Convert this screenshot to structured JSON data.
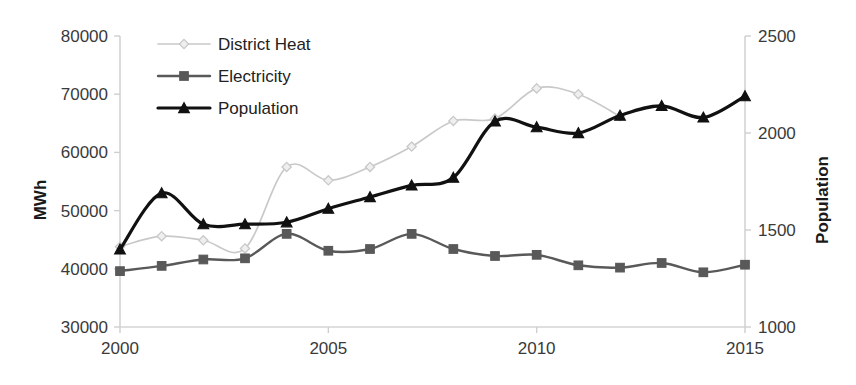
{
  "chart_data": {
    "type": "line",
    "title": "",
    "xlabel": "",
    "ylabel": "MWh",
    "y2label": "Population",
    "x": [
      2000,
      2001,
      2002,
      2003,
      2004,
      2005,
      2006,
      2007,
      2008,
      2009,
      2010,
      2011,
      2012,
      2013,
      2014,
      2015
    ],
    "xlim": [
      2000,
      2015
    ],
    "xticks": [
      "2000",
      "2005",
      "2010",
      "2015"
    ],
    "xtick_values": [
      2000,
      2005,
      2010,
      2015
    ],
    "ylim": [
      30000,
      80000
    ],
    "yticks": [
      "30000",
      "40000",
      "50000",
      "60000",
      "70000",
      "80000"
    ],
    "ytick_values": [
      30000,
      40000,
      50000,
      60000,
      70000,
      80000
    ],
    "y2lim": [
      1000,
      2500
    ],
    "y2ticks": [
      "1000",
      "1500",
      "2000",
      "2500"
    ],
    "y2tick_values": [
      1000,
      1500,
      2000,
      2500
    ],
    "grid": false,
    "legend_position": "top-left",
    "series": [
      {
        "name": "District Heat",
        "axis": "left",
        "color": "#c9c9c9",
        "marker": "diamond",
        "x": [
          2000,
          2001,
          2002,
          2003,
          2004,
          2005,
          2006,
          2007,
          2008,
          2009,
          2010,
          2011,
          2012
        ],
        "values": [
          43800,
          45600,
          44900,
          43500,
          57500,
          55200,
          57500,
          61000,
          65400,
          65800,
          71000,
          70000,
          66200
        ]
      },
      {
        "name": "Electricity",
        "axis": "left",
        "color": "#595959",
        "marker": "square",
        "x": [
          2000,
          2001,
          2002,
          2003,
          2004,
          2005,
          2006,
          2007,
          2008,
          2009,
          2010,
          2011,
          2012,
          2013,
          2014,
          2015
        ],
        "values": [
          39600,
          40500,
          41600,
          41800,
          46000,
          43100,
          43400,
          46000,
          43400,
          42200,
          42400,
          40600,
          40200,
          41000,
          39400,
          40700
        ]
      },
      {
        "name": "Population",
        "axis": "right",
        "color": "#111111",
        "marker": "triangle",
        "x": [
          2000,
          2001,
          2002,
          2003,
          2004,
          2005,
          2006,
          2007,
          2008,
          2009,
          2010,
          2011,
          2012,
          2013,
          2014,
          2015
        ],
        "values": [
          1400,
          1690,
          1530,
          1530,
          1540,
          1610,
          1670,
          1730,
          1770,
          2060,
          2030,
          2000,
          2090,
          2140,
          2080,
          2190
        ]
      }
    ]
  },
  "legend": {
    "items": [
      {
        "label": "District Heat"
      },
      {
        "label": "Electricity"
      },
      {
        "label": "Population"
      }
    ]
  },
  "axes": {
    "left_title": "MWh",
    "right_title": "Population"
  }
}
